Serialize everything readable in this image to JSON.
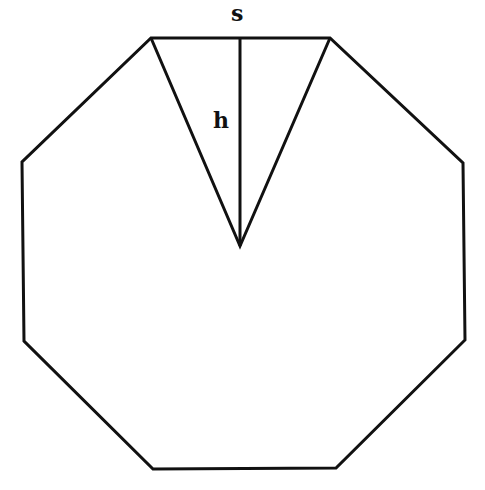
{
  "diagram": {
    "shape": "regular octagon",
    "stroke_color": "#111111",
    "background": "#ffffff",
    "octagon_vertices": [
      [
        151,
        38
      ],
      [
        330,
        38
      ],
      [
        463,
        163
      ],
      [
        465,
        340
      ],
      [
        336,
        468
      ],
      [
        153,
        469
      ],
      [
        24,
        341
      ],
      [
        22,
        162
      ]
    ],
    "triangle": {
      "apex": [
        240,
        246
      ],
      "base_left": [
        151,
        38
      ],
      "base_right": [
        330,
        38
      ]
    },
    "height_line": {
      "from": [
        240,
        38
      ],
      "to": [
        240,
        246
      ]
    },
    "labels": {
      "side": "s",
      "height": "h"
    }
  }
}
